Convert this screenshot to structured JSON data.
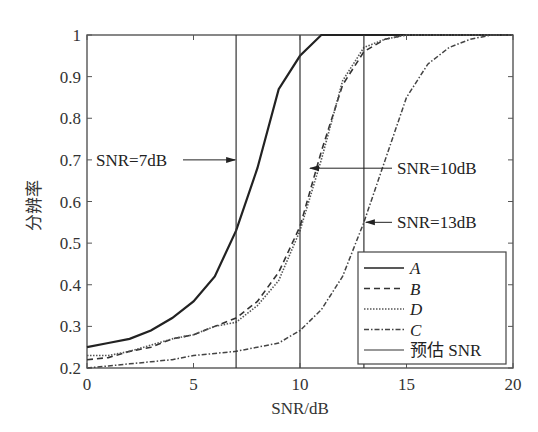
{
  "chart_data": {
    "type": "line",
    "title": "",
    "xlabel": "SNR/dB",
    "ylabel": "分辨率",
    "xlim": [
      0,
      20
    ],
    "ylim": [
      0.2,
      1
    ],
    "xticks": [
      "0",
      "5",
      "10",
      "15",
      "20"
    ],
    "yticks": [
      "0.2",
      "0.3",
      "0.4",
      "0.5",
      "0.6",
      "0.7",
      "0.8",
      "0.9",
      "1"
    ],
    "grid": false,
    "legend_position": "lower right",
    "x": [
      0,
      1,
      2,
      3,
      4,
      5,
      6,
      7,
      8,
      9,
      10,
      11,
      12,
      13,
      14,
      15,
      16,
      17,
      18,
      19,
      20
    ],
    "series": [
      {
        "name": "A",
        "style": "solid-thick",
        "values": [
          0.25,
          0.26,
          0.27,
          0.29,
          0.32,
          0.36,
          0.42,
          0.53,
          0.68,
          0.87,
          0.95,
          1.0,
          1.0,
          1.0,
          1.0,
          1.0,
          1.0,
          1.0,
          1.0,
          1.0,
          1.0
        ]
      },
      {
        "name": "B",
        "style": "dashed",
        "values": [
          0.22,
          0.225,
          0.24,
          0.25,
          0.27,
          0.28,
          0.3,
          0.32,
          0.36,
          0.43,
          0.54,
          0.72,
          0.88,
          0.96,
          0.99,
          1.0,
          1.0,
          1.0,
          1.0,
          1.0,
          1.0
        ]
      },
      {
        "name": "D",
        "style": "dotted",
        "values": [
          0.23,
          0.23,
          0.24,
          0.255,
          0.27,
          0.28,
          0.3,
          0.31,
          0.35,
          0.41,
          0.53,
          0.7,
          0.89,
          0.97,
          0.99,
          1.0,
          1.0,
          1.0,
          1.0,
          1.0,
          1.0
        ]
      },
      {
        "name": "C",
        "style": "dash-dot",
        "values": [
          0.2,
          0.205,
          0.21,
          0.215,
          0.22,
          0.23,
          0.235,
          0.24,
          0.25,
          0.26,
          0.29,
          0.34,
          0.42,
          0.55,
          0.7,
          0.85,
          0.93,
          0.97,
          0.99,
          1.0,
          1.0
        ]
      }
    ],
    "vertical_lines": [
      {
        "name": "预估 SNR",
        "x": 7
      },
      {
        "name": "预估 SNR",
        "x": 10
      },
      {
        "name": "预估 SNR",
        "x": 13
      }
    ],
    "annotations": [
      {
        "text": "SNR=7dB",
        "point_x": 7,
        "point_y": 0.7
      },
      {
        "text": "SNR=10dB",
        "point_x": 10,
        "point_y": 0.68
      },
      {
        "text": "SNR=13dB",
        "point_x": 13,
        "point_y": 0.55
      }
    ]
  },
  "legend": {
    "items": [
      {
        "label": "A"
      },
      {
        "label": "B"
      },
      {
        "label": "D"
      },
      {
        "label": "C"
      },
      {
        "label": "预估 SNR"
      }
    ]
  }
}
